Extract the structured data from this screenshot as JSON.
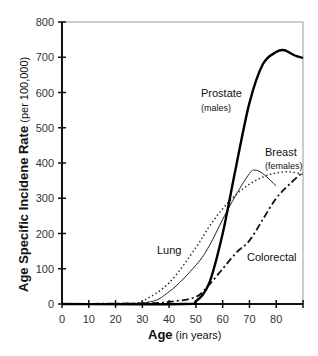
{
  "chart_data": {
    "type": "line",
    "title": "",
    "xlabel": "Age",
    "xlabel_suffix": "(in years)",
    "ylabel": "Age Specific Incidene Rate",
    "ylabel_suffix": "(per 100,000)",
    "xlim": [
      0,
      90
    ],
    "ylim": [
      0,
      800
    ],
    "x_ticks": [
      0,
      10,
      20,
      30,
      40,
      50,
      60,
      70,
      80,
      90
    ],
    "x_tick_labels": [
      "0",
      "10",
      "20",
      "30",
      "40",
      "50",
      "60",
      "70",
      "80",
      ""
    ],
    "y_ticks": [
      0,
      100,
      200,
      300,
      400,
      500,
      600,
      700,
      800
    ],
    "y_tick_labels": [
      "0",
      "100",
      "200",
      "300",
      "400",
      "500",
      "600",
      "700",
      "800"
    ],
    "grid": false,
    "legend": "inline labels",
    "series": [
      {
        "name": "Prostate",
        "sublabel": "(males)",
        "style": "thick-solid",
        "x": [
          0,
          45,
          50,
          55,
          60,
          65,
          70,
          75,
          80,
          83,
          87,
          90
        ],
        "y": [
          0,
          0,
          8,
          60,
          200,
          390,
          570,
          680,
          715,
          720,
          705,
          698
        ]
      },
      {
        "name": "Lung",
        "sublabel": "",
        "style": "thin-solid",
        "x": [
          0,
          30,
          40,
          50,
          55,
          60,
          65,
          70,
          72,
          75,
          80
        ],
        "y": [
          0,
          3,
          35,
          110,
          165,
          240,
          310,
          370,
          380,
          370,
          335
        ]
      },
      {
        "name": "Breast",
        "sublabel": "(females)",
        "style": "dotted",
        "x": [
          0,
          25,
          30,
          40,
          50,
          55,
          60,
          65,
          70,
          75,
          80,
          85,
          90
        ],
        "y": [
          0,
          2,
          8,
          60,
          160,
          220,
          270,
          310,
          340,
          360,
          372,
          375,
          368
        ]
      },
      {
        "name": "Colorectal",
        "sublabel": "",
        "style": "dashed",
        "x": [
          0,
          30,
          40,
          50,
          55,
          60,
          65,
          70,
          75,
          80,
          85,
          90
        ],
        "y": [
          0,
          2,
          6,
          20,
          55,
          100,
          145,
          180,
          240,
          300,
          340,
          375
        ]
      }
    ]
  },
  "labels": {
    "prostate": "Prostate",
    "prostate_sub": "(males)",
    "breast": "Breast",
    "breast_sub": "(females)",
    "lung": "Lung",
    "colorectal": "Colorectal",
    "x_title": "Age",
    "x_title_suffix": " (in years)",
    "y_title": "Age Specific Incidene Rate",
    "y_title_suffix": " (per 100,000)"
  }
}
